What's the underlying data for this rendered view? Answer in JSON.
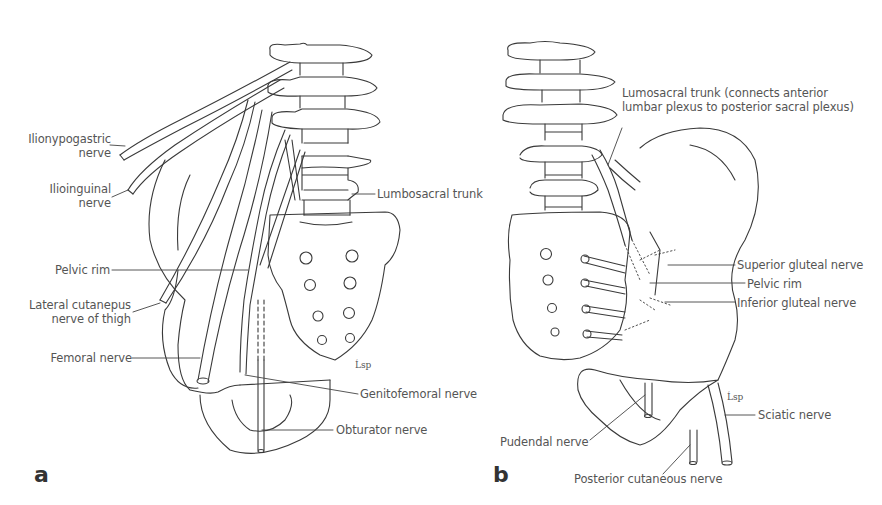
{
  "figure": {
    "panels": [
      {
        "letter": "a",
        "view": "anterior",
        "labels": {
          "iliohypogastric_1": "Ilionypogastric",
          "iliohypogastric_2": "nerve",
          "ilioinguinal_1": "Ilioinguinal",
          "ilioinguinal_2": "nerve",
          "lumbosacral_trunk": "Lumbosacral trunk",
          "pelvic_rim": "Pelvic rim",
          "lat_cut_1": "Lateral cutanepus",
          "lat_cut_2": "nerve of thigh",
          "femoral": "Femoral nerve",
          "genitofemoral": "Genitofemoral nerve",
          "obturator": "Obturator nerve"
        },
        "signature": "Ĺsp"
      },
      {
        "letter": "b",
        "view": "posterior",
        "labels": {
          "lumosacral_1": "Lumosacral trunk (connects anterior",
          "lumosacral_2": "lumbar plexus to posterior sacral plexus)",
          "superior_gluteal": "Superior gluteal nerve",
          "pelvic_rim": "Pelvic rim",
          "inferior_gluteal": "Inferior gluteal nerve",
          "sciatic": "Sciatic nerve",
          "pudendal": "Pudendal nerve",
          "posterior_cutaneous": "Posterior cutaneous nerve"
        },
        "signature": "Ĺsp"
      }
    ],
    "colors": {
      "line": "#3a3a3a",
      "text": "#555555",
      "background": "#ffffff"
    }
  }
}
